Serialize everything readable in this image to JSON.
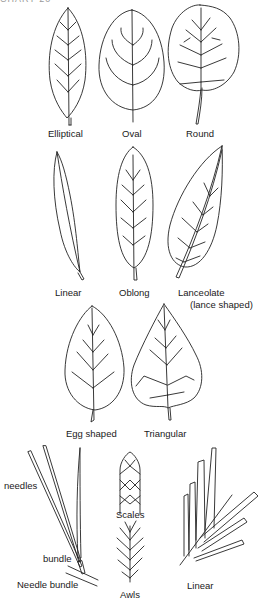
{
  "header_fragment": "CHART 20",
  "broadleaf_shapes": [
    {
      "id": "elliptical",
      "label": "Elliptical"
    },
    {
      "id": "oval",
      "label": "Oval"
    },
    {
      "id": "round",
      "label": "Round"
    },
    {
      "id": "linear",
      "label": "Linear"
    },
    {
      "id": "oblong",
      "label": "Oblong"
    },
    {
      "id": "lanceolate",
      "label": "Lanceolate",
      "sublabel": "(lance shaped)"
    },
    {
      "id": "egg-shaped",
      "label": "Egg shaped"
    },
    {
      "id": "triangular",
      "label": "Triangular"
    }
  ],
  "conifer_shapes": {
    "needle_bundle": {
      "label": "Needle bundle",
      "callouts": [
        "needles",
        "bundle"
      ]
    },
    "scales": {
      "label": "Scales"
    },
    "awls": {
      "label": "Awls"
    },
    "linear": {
      "label": "Linear"
    }
  },
  "colors": {
    "ink": "#222222",
    "background": "#ffffff"
  }
}
